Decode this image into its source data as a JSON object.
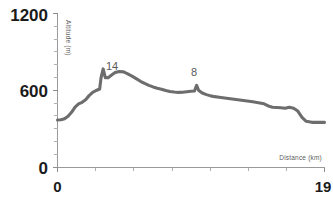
{
  "chart_data": {
    "type": "line",
    "title": "",
    "subtitle": "",
    "xlabel": "Distance (km)",
    "ylabel": "Altitude (m)",
    "xlim": [
      0,
      19
    ],
    "ylim": [
      0,
      1200
    ],
    "grid": false,
    "legend": "none",
    "x_tick_labels": [
      "0",
      "19"
    ],
    "y_tick_labels": [
      "0",
      "600",
      "1200"
    ],
    "y_tick_values": [
      0,
      600,
      1200
    ],
    "x_tick_values": [
      0,
      19
    ],
    "x_minor_tick_count": 6,
    "y_minor_tick_step": 100,
    "line_color": "#6d6d6d",
    "axis_color": "#9a9a9a",
    "annotations": [
      {
        "label": "14",
        "x": 3.1,
        "y": 770
      },
      {
        "label": "8",
        "x": 9.9,
        "y": 600
      }
    ],
    "series": [
      {
        "name": "elevation-profile",
        "x": [
          0.0,
          0.25,
          0.5,
          0.75,
          1.0,
          1.25,
          1.5,
          1.75,
          2.0,
          2.25,
          2.5,
          2.75,
          3.0,
          3.1,
          3.25,
          3.4,
          3.6,
          3.85,
          4.1,
          4.4,
          4.7,
          5.0,
          5.3,
          5.6,
          5.9,
          6.2,
          6.5,
          6.8,
          7.1,
          7.4,
          7.7,
          8.0,
          8.3,
          8.6,
          8.9,
          9.2,
          9.5,
          9.75,
          9.9,
          10.05,
          10.3,
          10.6,
          10.9,
          11.2,
          11.5,
          11.9,
          12.3,
          12.7,
          13.1,
          13.5,
          13.9,
          14.3,
          14.7,
          15.0,
          15.3,
          15.6,
          15.9,
          16.2,
          16.5,
          16.8,
          17.1,
          17.4,
          17.7,
          18.1,
          18.5,
          19.0
        ],
        "y": [
          370,
          372,
          380,
          400,
          430,
          470,
          495,
          508,
          528,
          560,
          585,
          600,
          612,
          700,
          768,
          700,
          700,
          720,
          740,
          748,
          745,
          730,
          712,
          692,
          672,
          655,
          640,
          628,
          618,
          610,
          600,
          592,
          588,
          585,
          586,
          590,
          594,
          596,
          640,
          600,
          580,
          568,
          558,
          552,
          548,
          542,
          536,
          530,
          524,
          518,
          512,
          505,
          496,
          480,
          470,
          468,
          466,
          462,
          470,
          462,
          440,
          390,
          360,
          352,
          352,
          352
        ]
      }
    ]
  },
  "axes": {
    "y_label_top": "1200",
    "y_label_mid": "600",
    "y_label_zero": "0",
    "x_label_start": "0",
    "x_label_end": "19",
    "x_axis_title": "Distance (km)",
    "y_axis_title": "Altitude (m)"
  },
  "annotations": {
    "peak_label": "14",
    "bump_label": "8"
  }
}
